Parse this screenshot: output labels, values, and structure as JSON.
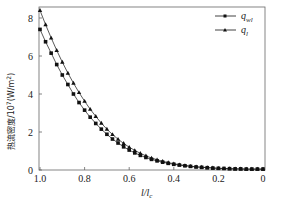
{
  "chart_data": {
    "type": "line",
    "title": "",
    "xlabel": "l/l_c",
    "ylabel": "热流密度/10^7(W/m^2)",
    "xlim": [
      1.0,
      0.0
    ],
    "ylim": [
      0,
      8.6
    ],
    "x_reversed": true,
    "xticks": [
      "1.0",
      "0.8",
      "0.6",
      "0.4",
      "0.2",
      "0"
    ],
    "yticks": [
      "0",
      "2",
      "4",
      "6",
      "8"
    ],
    "grid": false,
    "legend_position": "upper right",
    "x": [
      1.0,
      0.975,
      0.95,
      0.925,
      0.9,
      0.875,
      0.85,
      0.825,
      0.8,
      0.775,
      0.75,
      0.725,
      0.7,
      0.675,
      0.65,
      0.625,
      0.6,
      0.575,
      0.55,
      0.525,
      0.5,
      0.475,
      0.45,
      0.425,
      0.4,
      0.375,
      0.35,
      0.325,
      0.3,
      0.275,
      0.25,
      0.225,
      0.2,
      0.175,
      0.15,
      0.125,
      0.1,
      0.075,
      0.05,
      0.025,
      0.0
    ],
    "series": [
      {
        "name": "q_wl",
        "marker": "square",
        "values": [
          7.4,
          6.75,
          6.15,
          5.55,
          5.0,
          4.5,
          4.0,
          3.55,
          3.15,
          2.78,
          2.45,
          2.15,
          1.88,
          1.63,
          1.42,
          1.22,
          1.05,
          0.9,
          0.77,
          0.66,
          0.56,
          0.48,
          0.41,
          0.35,
          0.3,
          0.26,
          0.22,
          0.19,
          0.16,
          0.14,
          0.12,
          0.1,
          0.09,
          0.08,
          0.07,
          0.06,
          0.06,
          0.05,
          0.05,
          0.05,
          0.05
        ]
      },
      {
        "name": "q_l",
        "marker": "triangle",
        "values": [
          8.4,
          7.65,
          6.95,
          6.3,
          5.68,
          5.1,
          4.57,
          4.08,
          3.62,
          3.2,
          2.82,
          2.47,
          2.15,
          1.87,
          1.62,
          1.4,
          1.2,
          1.03,
          0.88,
          0.75,
          0.63,
          0.54,
          0.46,
          0.39,
          0.33,
          0.28,
          0.24,
          0.2,
          0.17,
          0.15,
          0.13,
          0.11,
          0.09,
          0.08,
          0.07,
          0.06,
          0.06,
          0.05,
          0.05,
          0.05,
          0.05
        ]
      }
    ]
  },
  "legend": {
    "items": [
      {
        "label_main": "q",
        "label_sub": "wl",
        "marker": "square"
      },
      {
        "label_main": "q",
        "label_sub": "l",
        "marker": "triangle"
      }
    ]
  },
  "axes": {
    "xlabel_main": "l/l",
    "xlabel_sub": "c",
    "ylabel_text": "热流密度/10",
    "ylabel_exp": "7",
    "ylabel_unit": "(W/m",
    "ylabel_unit_exp": "2",
    "ylabel_close": ")"
  },
  "colors": {
    "line": "#111111",
    "axis": "#555555"
  }
}
